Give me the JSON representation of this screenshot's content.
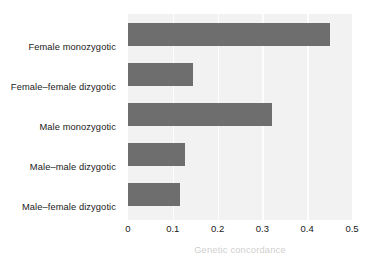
{
  "chart_data": {
    "type": "bar",
    "orientation": "horizontal",
    "title": "",
    "xlabel": "Genetic concordance",
    "ylabel": "",
    "categories": [
      "Female monozygotic",
      "Female–female dizygotic",
      "Male monozygotic",
      "Male–male dizygotic",
      "Male–female dizygotic"
    ],
    "values": [
      0.45,
      0.146,
      0.322,
      0.128,
      0.117
    ],
    "xlim": [
      0,
      0.5
    ],
    "xticks": [
      0,
      0.1,
      0.2,
      0.3,
      0.4,
      0.5
    ],
    "xticklabels": [
      "0",
      "0.1",
      "0.2",
      "0.3",
      "0.4",
      "0.5"
    ],
    "grid": "vertical",
    "legend": "none",
    "bar_color": "#6e6e6e",
    "plot_background": "#f2f2f2",
    "gridline_color": "#fdfdfd",
    "axis_label_color": "#cfcfcf",
    "tick_label_color": "#1a1a1a"
  }
}
